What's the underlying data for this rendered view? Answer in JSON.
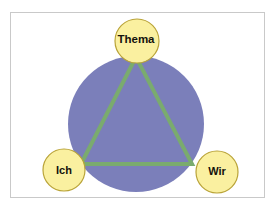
{
  "diagram": {
    "type": "triangle-in-circle",
    "frame": {
      "border_color": "#c9c9c9",
      "background_color": "#ffffff"
    },
    "circle": {
      "name": "globe-circle",
      "fill_color": "#7b7fba",
      "center_x": 136,
      "center_y": 124,
      "radius": 68
    },
    "triangle": {
      "name": "tzi-triangle",
      "stroke_color": "#7aab6e",
      "fill_color": "none",
      "stroke_width": 4,
      "vertices": [
        {
          "x": 136,
          "y": 57
        },
        {
          "x": 81,
          "y": 164
        },
        {
          "x": 192,
          "y": 164
        }
      ]
    },
    "nodes": [
      {
        "id": "thema",
        "label": "Thema",
        "fill_color": "#faf0a0",
        "stroke_color": "#b9a337",
        "center_x": 137,
        "center_y": 41,
        "radius": 22
      },
      {
        "id": "ich",
        "label": "Ich",
        "fill_color": "#faf0a0",
        "stroke_color": "#b9a337",
        "center_x": 64,
        "center_y": 170,
        "radius": 21
      },
      {
        "id": "wir",
        "label": "Wir",
        "fill_color": "#faf0a0",
        "stroke_color": "#b9a337",
        "center_x": 217,
        "center_y": 172,
        "radius": 21
      }
    ]
  }
}
